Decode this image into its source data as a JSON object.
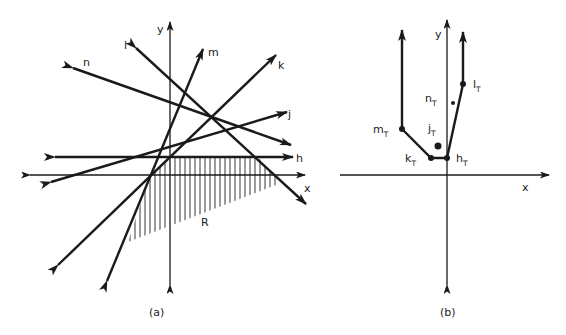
{
  "figure_a": {
    "caption": "(a)",
    "axes": {
      "x_label": "x",
      "y_label": "y"
    },
    "lines": [
      {
        "name": "h",
        "label": "h"
      },
      {
        "name": "j",
        "label": "j"
      },
      {
        "name": "k",
        "label": "k"
      },
      {
        "name": "l",
        "label": "l"
      },
      {
        "name": "m",
        "label": "m"
      },
      {
        "name": "n",
        "label": "n"
      }
    ],
    "region_label": "R"
  },
  "figure_b": {
    "caption": "(b)",
    "axes": {
      "x_label": "x",
      "y_label": "y"
    },
    "points": [
      {
        "name": "m",
        "label": "m",
        "sub": "T"
      },
      {
        "name": "k",
        "label": "k",
        "sub": "T"
      },
      {
        "name": "h",
        "label": "h",
        "sub": "T"
      },
      {
        "name": "l",
        "label": "l",
        "sub": "T"
      },
      {
        "name": "n",
        "label": "n",
        "sub": "T"
      },
      {
        "name": "j",
        "label": "j",
        "sub": "T"
      }
    ]
  }
}
